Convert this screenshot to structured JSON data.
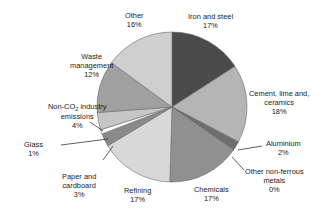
{
  "chart_data": {
    "type": "pie",
    "title": "",
    "subtitle": "",
    "xlabel": "",
    "ylabel": "",
    "legend_position": "none",
    "grid": false,
    "units": "percent",
    "value_suffix": "%",
    "start_angle_deg": 0,
    "direction": "clockwise",
    "categories": [
      "Iron and steel",
      "Cement, lime and, ceramics",
      "Aluminium",
      "Other non-ferrous metals",
      "Chemicals",
      "Refining",
      "Paper and cardboard",
      "Glass",
      "Non-CO2 industry emissions",
      "Waste management",
      "Other"
    ],
    "values": [
      17,
      18,
      2,
      0,
      17,
      17,
      3,
      1,
      4,
      12,
      16
    ],
    "colors": [
      "#4a4a4a",
      "#b5b5b5",
      "#6e6e6e",
      "#3c3c3c",
      "#909090",
      "#d8d8d8",
      "#8a8a8a",
      "#ffffff",
      "#c6c6c6",
      "#a0a0a0",
      "#cfcfcf"
    ],
    "slices": [
      {
        "label": "Iron and steel",
        "value": 17,
        "value_text": "17%",
        "color": "#4a4a4a"
      },
      {
        "label": "Cement, lime and, ceramics",
        "value": 18,
        "value_text": "18%",
        "color": "#b5b5b5"
      },
      {
        "label": "Aluminium",
        "value": 2,
        "value_text": "2%",
        "color": "#6e6e6e"
      },
      {
        "label": "Other non-ferrous metals",
        "value": 0,
        "value_text": "0%",
        "color": "#3c3c3c"
      },
      {
        "label": "Chemicals",
        "value": 17,
        "value_text": "17%",
        "color": "#909090"
      },
      {
        "label": "Refining",
        "value": 17,
        "value_text": "17%",
        "color": "#d8d8d8"
      },
      {
        "label": "Paper and cardboard",
        "value": 3,
        "value_text": "3%",
        "color": "#8a8a8a"
      },
      {
        "label": "Glass",
        "value": 1,
        "value_text": "1%",
        "color": "#ffffff"
      },
      {
        "label": "Non-CO2 industry emissions",
        "value": 4,
        "value_text": "4%",
        "color": "#c6c6c6"
      },
      {
        "label": "Waste management",
        "value": 12,
        "value_text": "12%",
        "color": "#a0a0a0"
      },
      {
        "label": "Other",
        "value": 16,
        "value_text": "16%",
        "color": "#cfcfcf"
      }
    ]
  },
  "labels": {
    "iron_and_steel": {
      "line1": "Iron and steel",
      "line2": "17%"
    },
    "cement": {
      "line1": "Cement, lime and,",
      "line2": "ceramics",
      "line3": "18%"
    },
    "aluminium": {
      "line1": "Aluminium",
      "line2": "2%"
    },
    "other_non_ferrous": {
      "line1": "Other non-ferrous",
      "line2": "metals",
      "line3": "0%"
    },
    "chemicals": {
      "line1": "Chemicals",
      "line2": "17%"
    },
    "refining": {
      "line1": "Refining",
      "line2": "17%"
    },
    "paper_and_cardboard": {
      "line1": "Paper and",
      "line2": "cardboard",
      "line3": "3%"
    },
    "glass": {
      "line1": "Glass",
      "line2": "1%"
    },
    "non_co2": {
      "prefix": "Non-CO",
      "sub": "2",
      "suffix": " industry",
      "line2": "emissions",
      "line3": "4%"
    },
    "waste_management": {
      "line1": "Waste",
      "line2": "management",
      "line3": "12%"
    },
    "other": {
      "line1": "Other",
      "line2": "16%"
    }
  }
}
